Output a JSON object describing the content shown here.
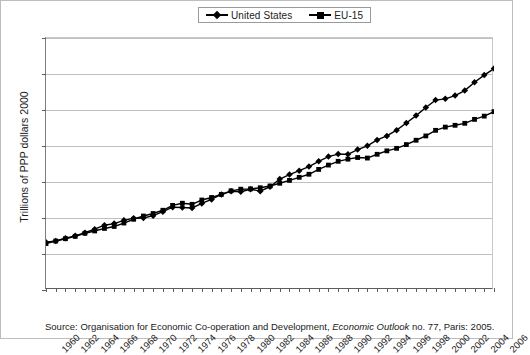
{
  "chart_data": {
    "type": "line",
    "title": "",
    "xlabel": "",
    "ylabel": "Trillions of PPP dollars 2000",
    "ylim": [
      0,
      14
    ],
    "yticks": [
      0,
      2,
      4,
      6,
      8,
      10,
      12,
      14
    ],
    "xlim": [
      1960,
      2006
    ],
    "xticks": [
      1960,
      1962,
      1964,
      1966,
      1968,
      1970,
      1972,
      1974,
      1976,
      1978,
      1980,
      1982,
      1984,
      1986,
      1988,
      1990,
      1992,
      1994,
      1996,
      1998,
      2000,
      2002,
      2004,
      2006
    ],
    "grid": true,
    "legend_position": "top-center",
    "x": [
      1960,
      1961,
      1962,
      1963,
      1964,
      1965,
      1966,
      1967,
      1968,
      1969,
      1970,
      1971,
      1972,
      1973,
      1974,
      1975,
      1976,
      1977,
      1978,
      1979,
      1980,
      1981,
      1982,
      1983,
      1984,
      1985,
      1986,
      1987,
      1988,
      1989,
      1990,
      1991,
      1992,
      1993,
      1994,
      1995,
      1996,
      1997,
      1998,
      1999,
      2000,
      2001,
      2002,
      2003,
      2004,
      2005,
      2006
    ],
    "series": [
      {
        "name": "United States",
        "marker": "diamond",
        "values": [
          2.65,
          2.72,
          2.88,
          3.01,
          3.18,
          3.38,
          3.6,
          3.69,
          3.87,
          3.99,
          4.0,
          4.13,
          4.35,
          4.6,
          4.58,
          4.56,
          4.81,
          5.03,
          5.31,
          5.48,
          5.46,
          5.6,
          5.49,
          5.74,
          6.16,
          6.41,
          6.63,
          6.86,
          7.15,
          7.41,
          7.55,
          7.54,
          7.8,
          8.01,
          8.34,
          8.56,
          8.88,
          9.28,
          9.69,
          10.14,
          10.55,
          10.62,
          10.8,
          11.08,
          11.54,
          11.94,
          12.3
        ]
      },
      {
        "name": "EU-15",
        "marker": "square",
        "values": [
          2.58,
          2.72,
          2.85,
          2.98,
          3.15,
          3.28,
          3.42,
          3.53,
          3.72,
          3.93,
          4.11,
          4.25,
          4.43,
          4.7,
          4.82,
          4.76,
          5.0,
          5.14,
          5.31,
          5.51,
          5.6,
          5.62,
          5.68,
          5.78,
          5.93,
          6.09,
          6.26,
          6.43,
          6.7,
          6.94,
          7.15,
          7.27,
          7.36,
          7.33,
          7.54,
          7.73,
          7.87,
          8.08,
          8.32,
          8.56,
          8.87,
          9.05,
          9.15,
          9.26,
          9.48,
          9.66,
          9.91
        ]
      }
    ]
  },
  "legend": {
    "entries": [
      {
        "label": "United States"
      },
      {
        "label": "EU-15"
      }
    ]
  },
  "source": {
    "prefix": "Source: Organisation for Economic Co-operation and Development, ",
    "italic": "Economic Outlook",
    "suffix": " no. 77, Paris: 2005."
  }
}
